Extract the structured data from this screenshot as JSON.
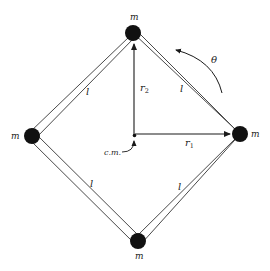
{
  "diagram": {
    "colors": {
      "ink": "#1a1a1a",
      "rod": "#555555",
      "mass": "#111111",
      "background": "#ffffff"
    },
    "masses": [
      {
        "id": "top",
        "label": "m",
        "x": 133,
        "y": 33
      },
      {
        "id": "right",
        "label": "m",
        "x": 240,
        "y": 134
      },
      {
        "id": "bottom",
        "label": "m",
        "x": 138,
        "y": 241
      },
      {
        "id": "left",
        "label": "m",
        "x": 32,
        "y": 136
      }
    ],
    "rods": [
      {
        "id": "top-left",
        "label": "l",
        "from": "top",
        "to": "left"
      },
      {
        "id": "top-right",
        "label": "l",
        "from": "top",
        "to": "right"
      },
      {
        "id": "bottom-left",
        "label": "l",
        "from": "left",
        "to": "bottom"
      },
      {
        "id": "bottom-right",
        "label": "l",
        "from": "bottom",
        "to": "right"
      }
    ],
    "center_of_mass": {
      "label": "c.m.",
      "x": 135,
      "y": 136
    },
    "vectors": {
      "r1": {
        "label": "r",
        "subscript": "1",
        "to": "right"
      },
      "r2": {
        "label": "r",
        "subscript": "2",
        "to": "top"
      }
    },
    "rotation": {
      "label": "θ",
      "direction": "counterclockwise"
    }
  }
}
